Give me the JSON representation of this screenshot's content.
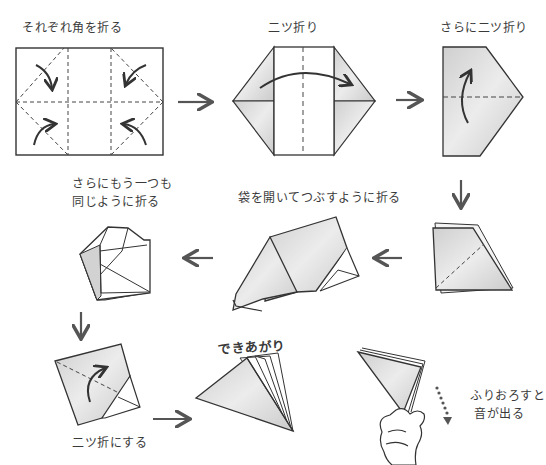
{
  "steps": [
    {
      "id": 1,
      "caption": "それぞれ角を折る"
    },
    {
      "id": 2,
      "caption": "二ツ折り"
    },
    {
      "id": 3,
      "caption": "さらに二ツ折り"
    },
    {
      "id": 4,
      "caption": ""
    },
    {
      "id": 5,
      "caption": "袋を開いてつぶすように折る"
    },
    {
      "id": 6,
      "caption_line1": "さらにもう一つも",
      "caption_line2": "同じように折る"
    },
    {
      "id": 7,
      "caption": "二ツ折にする"
    },
    {
      "id": 8,
      "caption": "できあがり"
    },
    {
      "id": 9,
      "caption_line1": "ふりおろすと",
      "caption_line2": "音が出る"
    }
  ],
  "colors": {
    "line": "#333333",
    "fill_shade": "#d6d6d6",
    "fill_light": "#e8e8e8",
    "arrow": "#555555"
  }
}
